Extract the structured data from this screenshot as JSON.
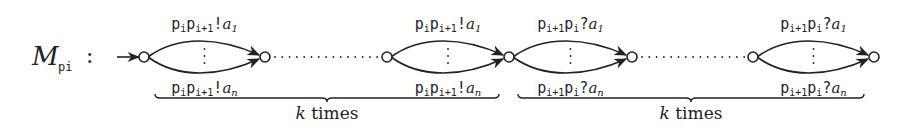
{
  "diagram": {
    "title": {
      "main": "M",
      "subscript": "pi",
      "separator": ":"
    },
    "colors": {
      "stroke": "#222222",
      "background": "#ffffff"
    },
    "nodes": [
      {
        "id": "q0",
        "x": 144,
        "y": 57,
        "initial": true
      },
      {
        "id": "q1",
        "x": 265,
        "y": 57
      },
      {
        "id": "q2",
        "x": 387,
        "y": 57
      },
      {
        "id": "q3",
        "x": 509,
        "y": 57
      },
      {
        "id": "q4",
        "x": 632,
        "y": 57
      },
      {
        "id": "q5",
        "x": 753,
        "y": 57
      },
      {
        "id": "q6",
        "x": 874,
        "y": 57
      }
    ],
    "edge_groups": [
      {
        "from": "q0",
        "to": "q1",
        "top_label": {
          "chan": [
            "p",
            "i",
            "p",
            "i+1"
          ],
          "op": "!",
          "msg": "a",
          "idx": "1"
        },
        "bottom_label": {
          "chan": [
            "p",
            "i",
            "p",
            "i+1"
          ],
          "op": "!",
          "msg": "a",
          "idx": "n"
        },
        "ellipsis": "⋮"
      },
      {
        "from": "q2",
        "to": "q3",
        "top_label": {
          "chan": [
            "p",
            "i",
            "p",
            "i+1"
          ],
          "op": "!",
          "msg": "a",
          "idx": "1"
        },
        "bottom_label": {
          "chan": [
            "p",
            "i",
            "p",
            "i+1"
          ],
          "op": "!",
          "msg": "a",
          "idx": "n"
        },
        "ellipsis": "⋮"
      },
      {
        "from": "q3",
        "to": "q4",
        "top_label": {
          "chan": [
            "p",
            "i+1",
            "p",
            "i"
          ],
          "op": "?",
          "msg": "a",
          "idx": "1"
        },
        "bottom_label": {
          "chan": [
            "p",
            "i+1",
            "p",
            "i"
          ],
          "op": "?",
          "msg": "a",
          "idx": "n"
        },
        "ellipsis": "⋮"
      },
      {
        "from": "q5",
        "to": "q6",
        "top_label": {
          "chan": [
            "p",
            "i+1",
            "p",
            "i"
          ],
          "op": "?",
          "msg": "a",
          "idx": "1"
        },
        "bottom_label": {
          "chan": [
            "p",
            "i+1",
            "p",
            "i"
          ],
          "op": "?",
          "msg": "a",
          "idx": "n"
        },
        "ellipsis": "⋮"
      }
    ],
    "dotted_links": [
      {
        "from": "q1",
        "to": "q2"
      },
      {
        "from": "q4",
        "to": "q5"
      }
    ],
    "braces": [
      {
        "x1": 155,
        "x2": 499,
        "label_k": "k",
        "label_rest": "times"
      },
      {
        "x1": 518,
        "x2": 864,
        "label_k": "k",
        "label_rest": "times"
      }
    ]
  }
}
